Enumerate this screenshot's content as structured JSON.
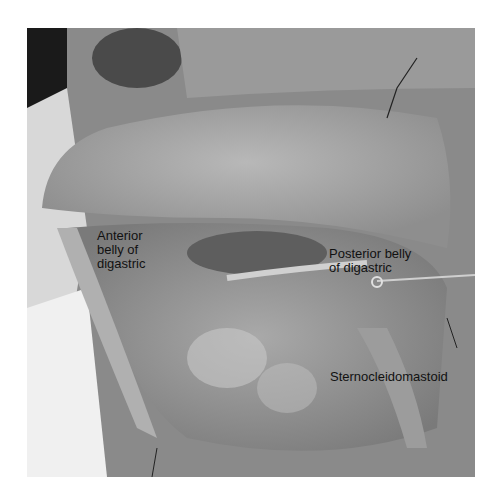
{
  "figure": {
    "labels": {
      "anterior_digastric": "Anterior\nbelly of\ndigastric",
      "posterior_digastric": "Posterior belly\nof digastric",
      "sternocleidomastoid": "Sternocleidomastoid"
    }
  }
}
